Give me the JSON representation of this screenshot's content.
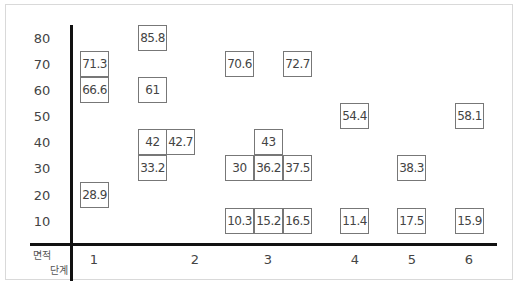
{
  "chart_data": {
    "type": "table",
    "title": "",
    "xlabel": "단계",
    "ylabel": "면적",
    "corner_labels": [
      "면적",
      "단계"
    ],
    "x_ticks": [
      "1",
      "2",
      "3",
      "4",
      "5",
      "6"
    ],
    "y_ticks": [
      "80",
      "70",
      "60",
      "50",
      "40",
      "30",
      "20",
      "10"
    ],
    "ylim": [
      10,
      80
    ],
    "grid": false,
    "points": [
      {
        "stage": 1,
        "band": 70,
        "value": 71.3
      },
      {
        "stage": 1,
        "band": 60,
        "value": 66.6
      },
      {
        "stage": 1,
        "band": 20,
        "value": 28.9
      },
      {
        "stage": 2,
        "band": 80,
        "value": 85.8
      },
      {
        "stage": 2,
        "band": 60,
        "value": 61
      },
      {
        "stage": 2,
        "band": 40,
        "value": 42
      },
      {
        "stage": 2,
        "band": 40,
        "value": 42.7
      },
      {
        "stage": 2,
        "band": 30,
        "value": 33.2
      },
      {
        "stage": 3,
        "band": 70,
        "value": 70.6
      },
      {
        "stage": 3,
        "band": 70,
        "value": 72.7
      },
      {
        "stage": 3,
        "band": 40,
        "value": 43
      },
      {
        "stage": 3,
        "band": 30,
        "value": 30
      },
      {
        "stage": 3,
        "band": 30,
        "value": 36.2
      },
      {
        "stage": 3,
        "band": 30,
        "value": 37.5
      },
      {
        "stage": 3,
        "band": 10,
        "value": 10.3
      },
      {
        "stage": 3,
        "band": 10,
        "value": 15.2
      },
      {
        "stage": 3,
        "band": 10,
        "value": 16.5
      },
      {
        "stage": 4,
        "band": 50,
        "value": 54.4
      },
      {
        "stage": 4,
        "band": 10,
        "value": 11.4
      },
      {
        "stage": 5,
        "band": 30,
        "value": 38.3
      },
      {
        "stage": 5,
        "band": 10,
        "value": 17.5
      },
      {
        "stage": 6,
        "band": 50,
        "value": 58.1
      },
      {
        "stage": 6,
        "band": 10,
        "value": 15.9
      }
    ]
  },
  "cells": [
    {
      "value": "71.3",
      "x": 80,
      "y": 51
    },
    {
      "value": "66.6",
      "x": 80,
      "y": 77
    },
    {
      "value": "28.9",
      "x": 80,
      "y": 182
    },
    {
      "value": "85.8",
      "x": 138,
      "y": 25
    },
    {
      "value": "61",
      "x": 138,
      "y": 77
    },
    {
      "value": "42",
      "x": 138,
      "y": 129
    },
    {
      "value": "42.7",
      "x": 166,
      "y": 129
    },
    {
      "value": "33.2",
      "x": 138,
      "y": 155
    },
    {
      "value": "70.6",
      "x": 225,
      "y": 51
    },
    {
      "value": "72.7",
      "x": 283,
      "y": 51
    },
    {
      "value": "43",
      "x": 254,
      "y": 129
    },
    {
      "value": "30",
      "x": 225,
      "y": 155
    },
    {
      "value": "36.2",
      "x": 254,
      "y": 155
    },
    {
      "value": "37.5",
      "x": 283,
      "y": 155
    },
    {
      "value": "10.3",
      "x": 225,
      "y": 208
    },
    {
      "value": "15.2",
      "x": 254,
      "y": 208
    },
    {
      "value": "16.5",
      "x": 283,
      "y": 208
    },
    {
      "value": "54.4",
      "x": 340,
      "y": 103
    },
    {
      "value": "11.4",
      "x": 340,
      "y": 208
    },
    {
      "value": "38.3",
      "x": 397,
      "y": 155
    },
    {
      "value": "17.5",
      "x": 397,
      "y": 208
    },
    {
      "value": "58.1",
      "x": 455,
      "y": 103
    },
    {
      "value": "15.9",
      "x": 455,
      "y": 208
    }
  ],
  "ytick_pos": [
    38,
    64,
    90,
    116,
    142,
    168,
    195,
    221
  ],
  "xtick_pos": [
    94,
    195,
    268,
    355,
    412,
    469
  ]
}
